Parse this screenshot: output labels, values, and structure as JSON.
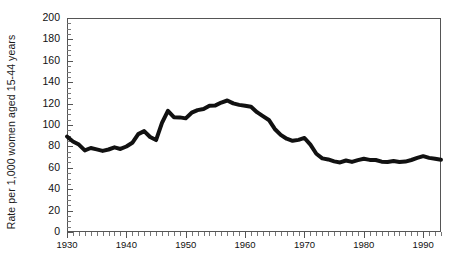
{
  "chart_data": {
    "type": "line",
    "title": "",
    "xlabel": "",
    "ylabel": "Rate per 1,000 women aged 15-44 years",
    "xlim": [
      1930,
      1993
    ],
    "ylim": [
      0,
      200
    ],
    "ytick_step": 20,
    "ytick_minor_step": 5,
    "xtick_step": 10,
    "xtick_minor_step": 1,
    "grid": false,
    "legend": "none",
    "line_color": "#111111",
    "line_width_px": 4,
    "yticks": [
      0,
      20,
      40,
      60,
      80,
      100,
      120,
      140,
      160,
      180,
      200
    ],
    "ytick_labels": [
      "0",
      "20",
      "40",
      "60",
      "80",
      "100",
      "120",
      "140",
      "160",
      "180",
      "200"
    ],
    "xticks": [
      1930,
      1940,
      1950,
      1960,
      1970,
      1980,
      1990
    ],
    "xtick_labels": [
      "1930",
      "1940",
      "1950",
      "1960",
      "1970",
      "1980",
      "1990"
    ],
    "x": [
      1930,
      1931,
      1932,
      1933,
      1934,
      1935,
      1936,
      1937,
      1938,
      1939,
      1940,
      1941,
      1942,
      1943,
      1944,
      1945,
      1946,
      1947,
      1948,
      1949,
      1950,
      1951,
      1952,
      1953,
      1954,
      1955,
      1956,
      1957,
      1958,
      1959,
      1960,
      1961,
      1962,
      1963,
      1964,
      1965,
      1966,
      1967,
      1968,
      1969,
      1970,
      1971,
      1972,
      1973,
      1974,
      1975,
      1976,
      1977,
      1978,
      1979,
      1980,
      1981,
      1982,
      1983,
      1984,
      1985,
      1986,
      1987,
      1988,
      1989,
      1990,
      1991,
      1992,
      1993
    ],
    "values": [
      89.2,
      84.6,
      81.7,
      76.3,
      78.5,
      77.2,
      75.8,
      77.1,
      79.1,
      77.6,
      79.9,
      83.4,
      91.5,
      94.3,
      88.8,
      85.9,
      101.9,
      113.3,
      107.3,
      107.1,
      106.2,
      111.5,
      113.9,
      115.0,
      118.1,
      118.3,
      121.0,
      122.9,
      120.2,
      118.8,
      118.0,
      117.1,
      112.0,
      108.3,
      104.7,
      96.3,
      90.8,
      87.2,
      85.2,
      86.1,
      87.9,
      81.6,
      73.1,
      68.8,
      67.8,
      66.0,
      65.0,
      66.8,
      65.5,
      67.2,
      68.4,
      67.4,
      67.3,
      65.7,
      65.5,
      66.3,
      65.4,
      65.8,
      67.3,
      69.2,
      70.9,
      69.3,
      68.4,
      67.6
    ]
  }
}
